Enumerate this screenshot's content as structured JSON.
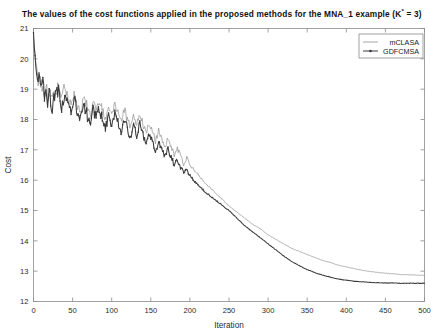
{
  "chart_data": {
    "type": "line",
    "title": "The values of the cost functions applied in the proposed methods for the MNA_1 example (K* = 3)",
    "title_prefix": "The values of the cost functions applied in the proposed methods for the MNA_1 example (K",
    "title_sup": "*",
    "title_suffix": " = 3)",
    "xlabel": "Iteration",
    "ylabel": "Cost",
    "xlim": [
      0,
      500
    ],
    "ylim": [
      12,
      21
    ],
    "xticks": [
      0,
      50,
      100,
      150,
      200,
      250,
      300,
      350,
      400,
      450,
      500
    ],
    "yticks": [
      12,
      13,
      14,
      15,
      16,
      17,
      18,
      19,
      20,
      21
    ],
    "grid": false,
    "legend_position": "top-right",
    "legend": [
      "mCLASA",
      "GDFCMSA"
    ],
    "colors": {
      "mCLASA": "#8f8f8f",
      "GDFCMSA": "#3a3a3a",
      "axis": "#8a8a8a",
      "text": "#1a1a1a"
    },
    "series": [
      {
        "name": "mCLASA",
        "marker": "none",
        "x": [
          0,
          2,
          4,
          6,
          8,
          10,
          12,
          14,
          16,
          18,
          20,
          24,
          28,
          32,
          36,
          40,
          44,
          48,
          52,
          56,
          60,
          64,
          68,
          72,
          76,
          80,
          84,
          88,
          92,
          96,
          100,
          104,
          108,
          112,
          116,
          120,
          124,
          128,
          132,
          136,
          140,
          144,
          148,
          152,
          156,
          160,
          164,
          168,
          172,
          176,
          180,
          184,
          188,
          192,
          196,
          200,
          210,
          220,
          230,
          240,
          250,
          260,
          270,
          280,
          290,
          300,
          310,
          320,
          330,
          340,
          350,
          360,
          370,
          380,
          390,
          400,
          410,
          420,
          430,
          440,
          450,
          460,
          470,
          480,
          490,
          500
        ],
        "y": [
          20.75,
          20.15,
          19.65,
          19.3,
          19.45,
          19.05,
          19.25,
          18.85,
          19.1,
          18.7,
          19.0,
          18.55,
          18.95,
          19.15,
          18.6,
          19.05,
          18.75,
          18.45,
          18.9,
          18.5,
          18.2,
          18.75,
          18.45,
          18.1,
          18.55,
          18.3,
          18.65,
          18.3,
          17.95,
          18.4,
          18.1,
          18.55,
          18.2,
          17.9,
          18.35,
          18.0,
          17.75,
          18.1,
          17.8,
          18.2,
          17.85,
          17.55,
          17.9,
          17.6,
          17.3,
          17.65,
          17.35,
          17.1,
          17.4,
          17.1,
          16.85,
          17.05,
          16.8,
          16.55,
          16.75,
          16.5,
          16.2,
          15.9,
          15.65,
          15.4,
          15.15,
          14.95,
          14.75,
          14.55,
          14.4,
          14.2,
          14.05,
          13.9,
          13.75,
          13.65,
          13.55,
          13.45,
          13.35,
          13.28,
          13.2,
          13.14,
          13.08,
          13.03,
          12.99,
          12.96,
          12.93,
          12.91,
          12.89,
          12.88,
          12.87,
          12.86
        ]
      },
      {
        "name": "GDFCMSA",
        "marker": "dot",
        "x": [
          0,
          2,
          4,
          6,
          8,
          10,
          12,
          14,
          16,
          18,
          20,
          24,
          28,
          32,
          36,
          40,
          44,
          48,
          52,
          56,
          60,
          64,
          68,
          72,
          76,
          80,
          84,
          88,
          92,
          96,
          100,
          104,
          108,
          112,
          116,
          120,
          124,
          128,
          132,
          136,
          140,
          144,
          148,
          152,
          156,
          160,
          164,
          168,
          172,
          176,
          180,
          184,
          188,
          192,
          196,
          200,
          210,
          220,
          230,
          240,
          250,
          260,
          270,
          280,
          290,
          300,
          310,
          320,
          330,
          340,
          350,
          360,
          370,
          380,
          390,
          400,
          410,
          420,
          430,
          440,
          450,
          460,
          470,
          480,
          490,
          500
        ],
        "y": [
          20.8,
          20.1,
          19.55,
          19.2,
          19.35,
          18.95,
          19.15,
          18.7,
          18.95,
          18.55,
          18.85,
          18.4,
          18.8,
          19.0,
          18.45,
          18.85,
          18.55,
          18.25,
          18.7,
          18.3,
          17.95,
          18.5,
          18.2,
          17.85,
          18.3,
          18.05,
          18.4,
          18.0,
          17.7,
          18.15,
          17.85,
          18.25,
          17.9,
          17.6,
          18.05,
          17.7,
          17.45,
          17.8,
          17.5,
          17.9,
          17.5,
          17.2,
          17.55,
          17.25,
          16.95,
          17.3,
          17.0,
          16.75,
          17.05,
          16.75,
          16.5,
          16.7,
          16.45,
          16.2,
          16.4,
          16.15,
          15.85,
          15.6,
          15.4,
          15.2,
          15.0,
          14.75,
          14.5,
          14.3,
          14.1,
          13.9,
          13.7,
          13.5,
          13.32,
          13.18,
          13.05,
          12.95,
          12.87,
          12.8,
          12.74,
          12.7,
          12.67,
          12.65,
          12.63,
          12.62,
          12.61,
          12.61,
          12.6,
          12.6,
          12.6,
          12.6
        ]
      }
    ]
  }
}
